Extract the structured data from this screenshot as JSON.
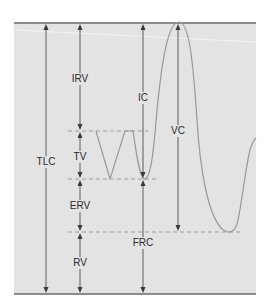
{
  "diagram": {
    "colors": {
      "panel_bg": "#e3e3e3",
      "border": "#6b6b6b",
      "arrows": "#3a3a3a",
      "curve": "#9a9a9a",
      "dashed": "#8a8a8a",
      "text": "#2a2a2a"
    },
    "labels": {
      "tlc": "TLC",
      "irv": "IRV",
      "tv": "TV",
      "erv": "ERV",
      "rv": "RV",
      "ic": "IC",
      "vc": "VC",
      "frc": "FRC"
    },
    "legend_meanings": {
      "TLC": "Total lung capacity",
      "IRV": "Inspiratory reserve volume",
      "TV": "Tidal volume",
      "ERV": "Expiratory reserve volume",
      "RV": "Residual volume",
      "IC": "Inspiratory capacity",
      "VC": "Vital capacity",
      "FRC": "Functional residual capacity"
    }
  }
}
